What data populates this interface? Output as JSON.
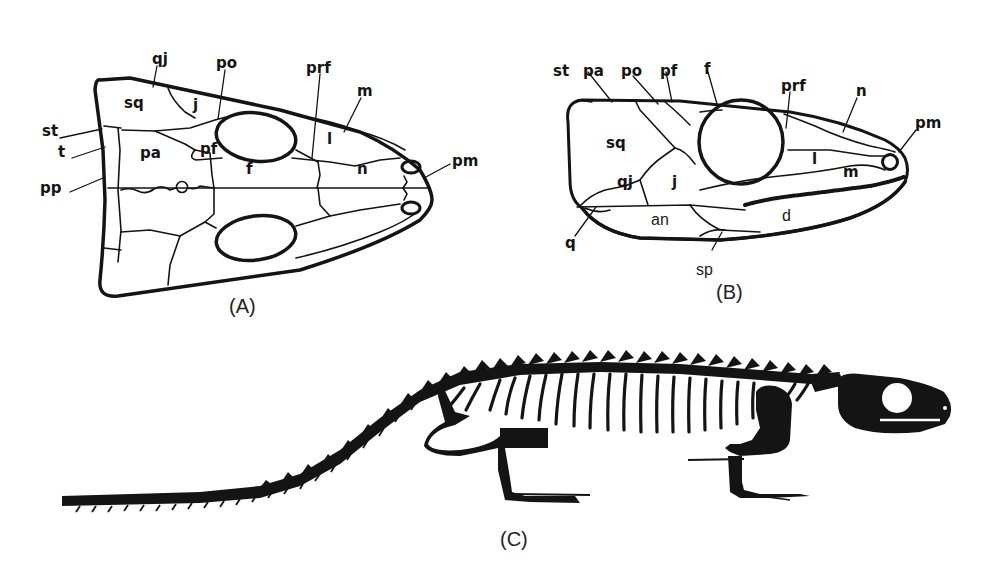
{
  "figure": {
    "panels": [
      {
        "id": "A",
        "label": "(A)",
        "description": "Skull, dorsal view",
        "bone_labels": {
          "qj": "qj",
          "po": "po",
          "prf": "prf",
          "m": "m",
          "sq": "sq",
          "j": "j",
          "st": "st",
          "t": "t",
          "pa": "pa",
          "pf": "pf",
          "l": "l",
          "pp": "pp",
          "f": "f",
          "n": "n",
          "pm": "pm"
        }
      },
      {
        "id": "B",
        "label": "(B)",
        "description": "Skull, lateral view",
        "bone_labels": {
          "st": "st",
          "pa": "pa",
          "po": "po",
          "pf": "pf",
          "f": "f",
          "prf": "prf",
          "n": "n",
          "pm": "pm",
          "sq": "sq",
          "qj": "qj",
          "j": "j",
          "l": "l",
          "m": "m",
          "an": "an",
          "d": "d",
          "q": "q",
          "sp": "sp"
        }
      },
      {
        "id": "C",
        "label": "(C)",
        "description": "Full skeleton, lateral view (silhouette)"
      }
    ],
    "colors": {
      "ink": "#141414",
      "background": "#ffffff"
    }
  }
}
